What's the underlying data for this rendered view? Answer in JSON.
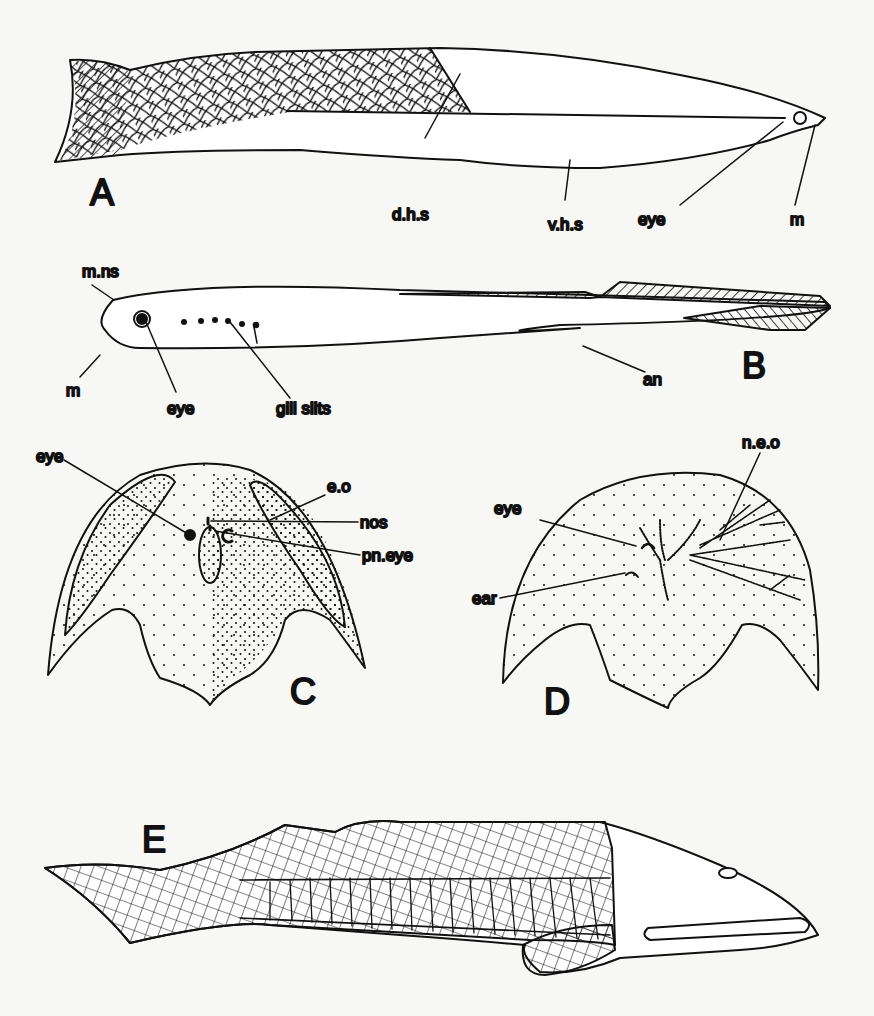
{
  "figure": {
    "panels": [
      {
        "id": "A",
        "label": "A",
        "annotations": [
          "d.h.s",
          "v.h.s",
          "eye",
          "m"
        ]
      },
      {
        "id": "B",
        "label": "B",
        "annotations": [
          "m.ns",
          "eye",
          "gill slits",
          "m",
          "an"
        ]
      },
      {
        "id": "C",
        "label": "C",
        "annotations": [
          "eye",
          "e.o",
          "nos",
          "pn.eye"
        ]
      },
      {
        "id": "D",
        "label": "D",
        "annotations": [
          "eye",
          "n.e.o",
          "ear"
        ]
      },
      {
        "id": "E",
        "label": "E",
        "annotations": []
      }
    ]
  },
  "labels": {
    "A": "A",
    "B": "B",
    "C": "C",
    "D": "D",
    "E": "E",
    "a_dhs": "d.h.s",
    "a_vhs": "v.h.s",
    "a_eye": "eye",
    "a_m": "m",
    "b_mns": "m.ns",
    "b_eye": "eye",
    "b_gill": "gill slits",
    "b_m": "m",
    "b_an": "an",
    "c_eye": "eye",
    "c_eo": "e.o",
    "c_nos": "nos",
    "c_pneye": "pn.eye",
    "d_eye": "eye",
    "d_neo": "n.e.o",
    "d_ear": "ear"
  }
}
